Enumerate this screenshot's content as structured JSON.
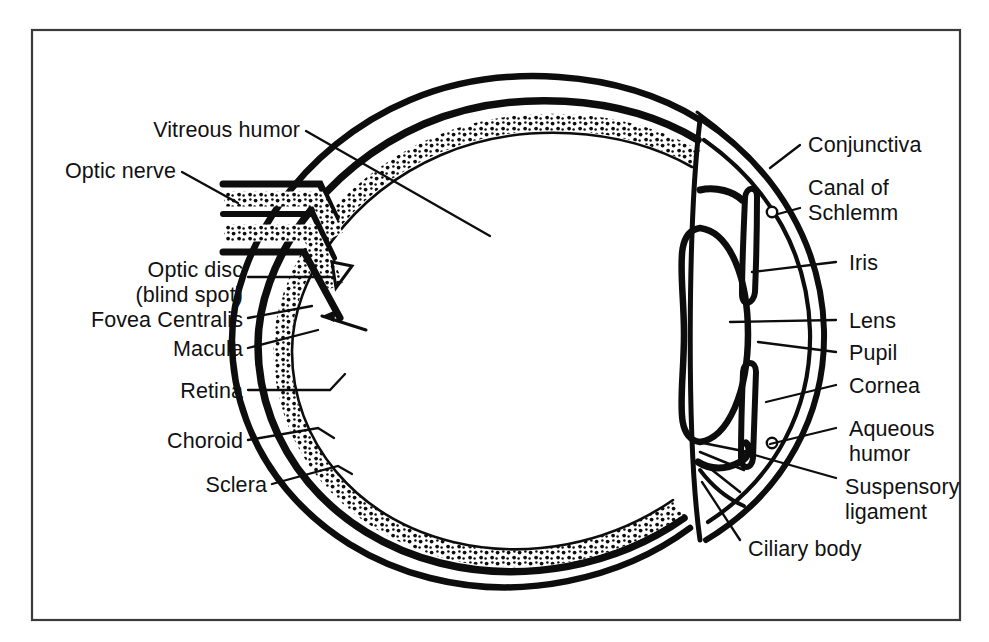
{
  "figure": {
    "background_color": "#ffffff",
    "ink_color": "#0d0d0d",
    "frame_color": "#3a3a3a"
  },
  "labels": {
    "vitreous_humor": "Vitreous humor",
    "optic_nerve": "Optic nerve",
    "optic_disc_line1": "Optic disc",
    "optic_disc_line2": "(blind spot)",
    "fovea_centralis": "Fovea Centralis",
    "macula": "Macula",
    "retina": "Retina",
    "choroid": "Choroid",
    "sclera": "Sclera",
    "conjunctiva": "Conjunctiva",
    "canal_of_schlemm_line1": "Canal of",
    "canal_of_schlemm_line2": "Schlemm",
    "iris": "Iris",
    "lens": "Lens",
    "pupil": "Pupil",
    "cornea": "Cornea",
    "aqueous_humor_line1": "Aqueous",
    "aqueous_humor_line2": "humor",
    "suspensory_ligament_line1": "Suspensory",
    "suspensory_ligament_line2": "ligament",
    "ciliary_body": "Ciliary body"
  },
  "structures": {
    "sclera": "outer white fibrous coat",
    "choroid": "middle vascular dark layer",
    "retina": "inner stippled light-sensitive layer",
    "optic_nerve": "stippled nerve bundle exiting posterior eye",
    "lens": "biconvex transparent oval",
    "iris": "hooked diaphragm anterior to lens",
    "cornea": "transparent anterior dome",
    "ciliary_body": "muscular ring anchoring lens",
    "canal_of_schlemm": "small circular duct at iridocorneal angle"
  }
}
